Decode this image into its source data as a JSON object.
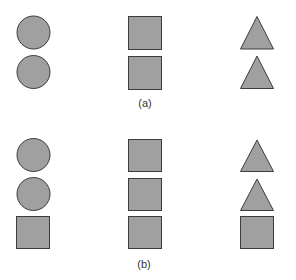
{
  "style": {
    "fill": "#a0a0a0",
    "stroke": "#3c3c3c",
    "background": "#ffffff"
  },
  "panels": [
    {
      "label": "(a)",
      "columns": [
        {
          "shapes": [
            "circle",
            "circle"
          ]
        },
        {
          "shapes": [
            "square",
            "square"
          ]
        },
        {
          "shapes": [
            "triangle",
            "triangle"
          ]
        }
      ]
    },
    {
      "label": "(b)",
      "columns": [
        {
          "shapes": [
            "circle",
            "circle",
            "square"
          ]
        },
        {
          "shapes": [
            "square",
            "square",
            "square"
          ]
        },
        {
          "shapes": [
            "triangle",
            "triangle",
            "square"
          ]
        }
      ]
    }
  ]
}
